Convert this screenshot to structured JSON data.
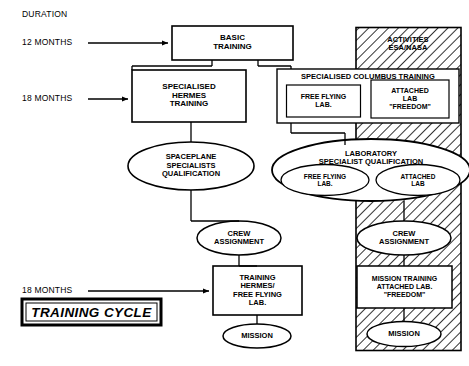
{
  "diagram": {
    "title": "TRAINING CYCLE",
    "duration_header": "DURATION",
    "durations": [
      {
        "label": "12 MONTHS"
      },
      {
        "label": "18 MONTHS"
      },
      {
        "label": "18 MONTHS"
      }
    ],
    "hatched_region": {
      "label": "ACTIVITIES\nESA/NASA"
    },
    "nodes": {
      "basic_training": "BASIC\nTRAINING",
      "specialised_hermes_training": "SPECIALISED\nHERMES\nTRAINING",
      "specialised_columbus_training": "SPECIALISED COLUMBUS TRAINING",
      "columbus_free_flying_lab": "FREE FLYING\nLAB.",
      "columbus_attached_lab": "ATTACHED\nLAB\n\"FREEDOM\"",
      "spaceplane_qualification": "SPACEPLANE\nSPECIALISTS\nQUALIFICATION",
      "laboratory_qualification": "LABORATORY\nSPECIALIST QUALIFICATION",
      "lab_free_flying": "FREE FLYING\nLAB.",
      "lab_attached": "ATTACHED\nLAB",
      "crew_assignment_left": "CREW\nASSIGNMENT",
      "crew_assignment_right": "CREW\nASSIGNMENT",
      "training_hermes_ffl": "TRAINING\nHERMES/\nFREE FLYING\nLAB.",
      "mission_training_attached": "MISSION TRAINING\nATTACHED LAB.\n\"FREEDOM\"",
      "mission_left": "MISSION",
      "mission_right": "MISSION"
    },
    "colors": {
      "ink": "#000000",
      "paper": "#ffffff"
    }
  }
}
